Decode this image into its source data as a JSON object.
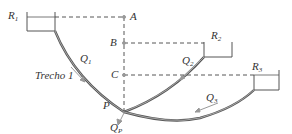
{
  "diagram": {
    "reservoirs": [
      {
        "id": "R1",
        "label": "R",
        "sub": "1"
      },
      {
        "id": "R2",
        "label": "R",
        "sub": "2"
      },
      {
        "id": "R3",
        "label": "R",
        "sub": "3"
      }
    ],
    "points": [
      {
        "id": "A",
        "label": "A"
      },
      {
        "id": "B",
        "label": "B"
      },
      {
        "id": "C",
        "label": "C"
      },
      {
        "id": "P",
        "label": "P"
      }
    ],
    "flows": [
      {
        "id": "Q1",
        "label": "Q",
        "sub": "1"
      },
      {
        "id": "Q2",
        "label": "Q",
        "sub": "2"
      },
      {
        "id": "Q3",
        "label": "Q",
        "sub": "3"
      },
      {
        "id": "QP",
        "label": "Q",
        "sub": "P"
      }
    ],
    "section_label": "Trecho 1",
    "colors": {
      "pipe": "#555555",
      "dashed": "#444444",
      "arrow": "#999999"
    }
  }
}
